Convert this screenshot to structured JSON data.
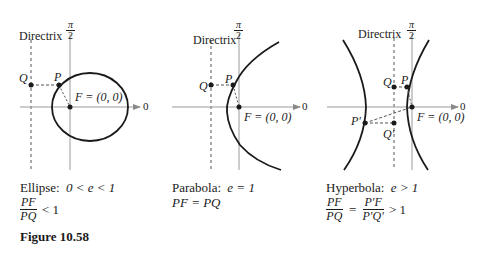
{
  "figure": {
    "number_label": "Figure 10.58",
    "panels": [
      {
        "id": "ellipse",
        "directrix_label": "Directrix",
        "axis_top_label_num": "π",
        "axis_top_label_den": "2",
        "axis_right_label": "0",
        "point_labels": {
          "Q": "Q",
          "P": "P",
          "F": "F = (0, 0)"
        },
        "caption_line1_name": "Ellipse:",
        "caption_line1_math": "0 < e < 1",
        "caption_frac_num": "PF",
        "caption_frac_den": "PQ",
        "caption_frac_rel": "< 1"
      },
      {
        "id": "parabola",
        "directrix_label": "Directrix",
        "axis_top_label_num": "π",
        "axis_top_label_den": "2",
        "axis_right_label": "0",
        "point_labels": {
          "Q": "Q",
          "P": "P",
          "F": "F = (0, 0)"
        },
        "caption_line1_name": "Parabola:",
        "caption_line1_math": "e = 1",
        "caption_line2": "PF = PQ"
      },
      {
        "id": "hyperbola",
        "directrix_label": "Directrix",
        "axis_top_label_num": "π",
        "axis_top_label_den": "2",
        "axis_right_label": "0",
        "point_labels": {
          "Q": "Q",
          "P": "P",
          "F": "F = (0, 0)",
          "P_prime": "P′",
          "Q_prime": "Q′"
        },
        "caption_line1_name": "Hyperbola:",
        "caption_line1_math": "e > 1",
        "caption_frac1_num": "PF",
        "caption_frac1_den": "PQ",
        "caption_eq": "=",
        "caption_frac2_num": "P′F",
        "caption_frac2_den": "P′Q′",
        "caption_frac_rel": "> 1"
      }
    ]
  }
}
